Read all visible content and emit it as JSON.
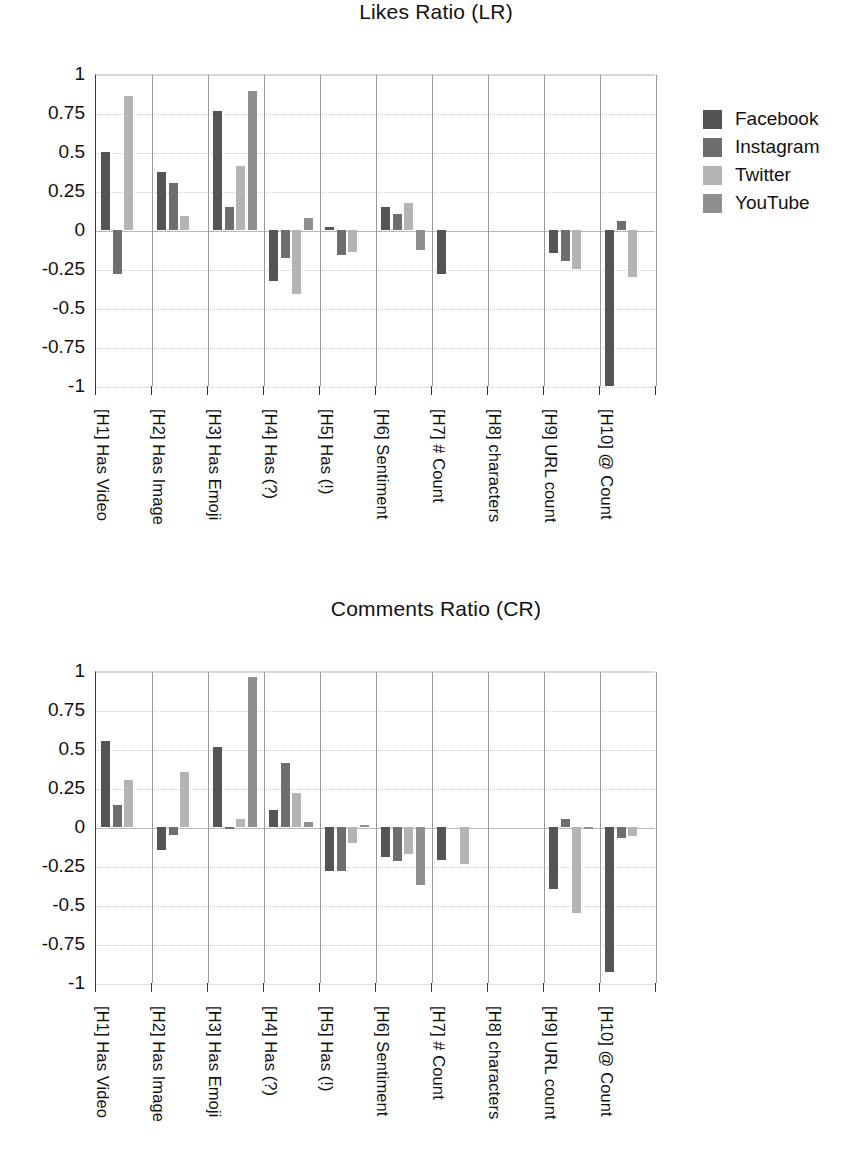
{
  "series_colors": {
    "Facebook": "#545454",
    "Instagram": "#6e6e6e",
    "Twitter": "#b4b4b4",
    "YouTube": "#8f8f8f"
  },
  "legend": {
    "position": "right-top",
    "entries": [
      {
        "label": "Facebook",
        "color": "#545454"
      },
      {
        "label": "Instagram",
        "color": "#6e6e6e"
      },
      {
        "label": "Twitter",
        "color": "#b4b4b4"
      },
      {
        "label": "YouTube",
        "color": "#8f8f8f"
      }
    ]
  },
  "yticks": [
    "1",
    "0.75",
    "0.5",
    "0.25",
    "0",
    "-0.25",
    "-0.5",
    "-0.75",
    "-1"
  ],
  "ytick_values": [
    1,
    0.75,
    0.5,
    0.25,
    0,
    -0.25,
    -0.5,
    -0.75,
    -1
  ],
  "categories": [
    "[H1] Has Video",
    "[H2] Has Image",
    "[H3] Has Emoji",
    "[H4] Has (?)",
    "[H5] Has (!)",
    "[H6] Sentiment",
    "[H7] # Count",
    "[H8] characters",
    "[H9] URL count",
    "[H10] @ Count"
  ],
  "chart_data": [
    {
      "type": "bar",
      "title": "Likes Ratio (LR)",
      "xlabel": "",
      "ylabel": "",
      "ylim": [
        -1,
        1
      ],
      "grid": true,
      "legend_position": "right",
      "categories": [
        "[H1] Has Video",
        "[H2] Has Image",
        "[H3] Has Emoji",
        "[H4] Has (?)",
        "[H5] Has (!)",
        "[H6] Sentiment",
        "[H7] # Count",
        "[H8] characters",
        "[H9] URL count",
        "[H10] @ Count"
      ],
      "series": [
        {
          "name": "Facebook",
          "values": [
            0.5,
            0.375,
            0.76,
            -0.33,
            0.02,
            0.15,
            -0.28,
            0,
            -0.15,
            -1.0
          ]
        },
        {
          "name": "Instagram",
          "values": [
            -0.28,
            0.3,
            0.15,
            -0.18,
            -0.16,
            0.1,
            0,
            0,
            -0.2,
            0.06
          ]
        },
        {
          "name": "Twitter",
          "values": [
            0.86,
            0.09,
            0.41,
            -0.41,
            -0.14,
            0.17,
            0,
            0,
            -0.25,
            -0.3
          ]
        },
        {
          "name": "YouTube",
          "values": [
            0,
            0,
            0.89,
            0.08,
            0,
            -0.13,
            0,
            0,
            0,
            0
          ]
        }
      ]
    },
    {
      "type": "bar",
      "title": "Comments Ratio (CR)",
      "xlabel": "",
      "ylabel": "",
      "ylim": [
        -1,
        1
      ],
      "grid": true,
      "legend_position": "none",
      "categories": [
        "[H1] Has Video",
        "[H2] Has Image",
        "[H3] Has Emoji",
        "[H4] Has (?)",
        "[H5] Has (!)",
        "[H6] Sentiment",
        "[H7] # Count",
        "[H8] characters",
        "[H9] URL count",
        "[H10] @ Count"
      ],
      "series": [
        {
          "name": "Facebook",
          "values": [
            0.55,
            -0.15,
            0.51,
            0.11,
            -0.28,
            -0.19,
            -0.21,
            0,
            -0.4,
            -0.93
          ]
        },
        {
          "name": "Instagram",
          "values": [
            0.14,
            -0.05,
            -0.01,
            0.41,
            -0.28,
            -0.22,
            0,
            0,
            0.05,
            -0.07
          ]
        },
        {
          "name": "Twitter",
          "values": [
            0.3,
            0.35,
            0.05,
            0.22,
            -0.1,
            -0.17,
            -0.24,
            0,
            -0.55,
            -0.06
          ]
        },
        {
          "name": "YouTube",
          "values": [
            0,
            0,
            0.96,
            0.03,
            0.01,
            -0.37,
            0,
            0,
            -0.01,
            0
          ]
        }
      ]
    }
  ]
}
